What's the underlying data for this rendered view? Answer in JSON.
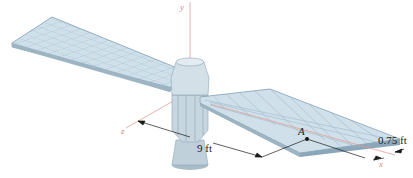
{
  "figure": {
    "axes": {
      "x": "x",
      "y": "y",
      "z": "z"
    },
    "point_label": "A",
    "dimensions": {
      "distance": "9 ft",
      "panel_offset": "0.75 ft"
    },
    "colors": {
      "panel_fill": "#cfe0ea",
      "panel_grid": "#9fb9c9",
      "panel_edge": "#8aa6b8",
      "body_fill": "#c8d6df",
      "body_shade": "#a9bcc8",
      "axis_color": "#e0a097",
      "dimension_line": "#1a1a1a"
    }
  }
}
